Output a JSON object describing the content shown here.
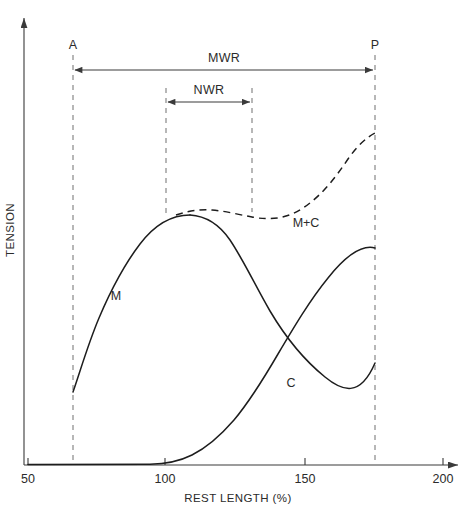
{
  "chart_data": {
    "type": "line",
    "title": "",
    "xlabel": "REST LENGTH (%)",
    "ylabel": "TENSION",
    "xlim": [
      50,
      200
    ],
    "ylim": [
      0,
      1
    ],
    "xticks": [
      50,
      100,
      150,
      200
    ],
    "xtick_labels": [
      "50",
      "100",
      "150",
      "200"
    ],
    "yticks": [],
    "ytick_labels": [],
    "grid": false,
    "legend": false,
    "axis_style": "arrow-ended open axes, no box",
    "series": [
      {
        "name": "M",
        "label": "M",
        "style": "solid",
        "description": "Active (muscle/contractile) tension: rises steeply from the A line, peaks near 110-115% rest length, then falls steadily to the P line.",
        "x": [
          66,
          70,
          75,
          80,
          85,
          90,
          95,
          100,
          105,
          110,
          115,
          120,
          125,
          130,
          135,
          140,
          145,
          150,
          155,
          160,
          165,
          170,
          176
        ],
        "y": [
          0.158,
          0.21,
          0.3,
          0.39,
          0.465,
          0.53,
          0.585,
          0.625,
          0.648,
          0.66,
          0.661,
          0.652,
          0.635,
          0.61,
          0.578,
          0.54,
          0.497,
          0.45,
          0.4,
          0.35,
          0.3,
          0.255,
          0.225
        ]
      },
      {
        "name": "C",
        "label": "C",
        "style": "solid",
        "description": "Passive (connective tissue) tension: flat at zero until about 105-110% rest length, then rises exponentially to the P line.",
        "x": [
          50,
          60,
          70,
          80,
          90,
          100,
          105,
          110,
          115,
          120,
          125,
          130,
          135,
          140,
          145,
          150,
          155,
          160,
          165,
          170,
          176
        ],
        "y": [
          0.0,
          0.0,
          0.0,
          0.0,
          0.0,
          0.003,
          0.006,
          0.014,
          0.028,
          0.048,
          0.073,
          0.104,
          0.14,
          0.182,
          0.23,
          0.285,
          0.345,
          0.41,
          0.48,
          0.555,
          0.645
        ]
      },
      {
        "name": "M+C",
        "label": "M+C",
        "style": "dashed",
        "description": "Total tension (sum of active and passive): follows the M curve up to the peak, dips slightly to a shallow minimum near 140%, then climbs sharply to the P line.",
        "x": [
          104,
          110,
          115,
          120,
          125,
          130,
          135,
          140,
          145,
          150,
          155,
          160,
          165,
          170,
          176
        ],
        "y": [
          0.655,
          0.668,
          0.672,
          0.668,
          0.66,
          0.651,
          0.645,
          0.645,
          0.655,
          0.675,
          0.708,
          0.75,
          0.8,
          0.858,
          0.92
        ]
      }
    ],
    "vertical_markers": [
      {
        "name": "A",
        "label": "A",
        "x": 66,
        "style": "dashed",
        "description": "Shortest active length limit"
      },
      {
        "name": "NWR-left",
        "label": "",
        "x": 100,
        "style": "dashed",
        "description": "Lower bound of normal working range"
      },
      {
        "name": "NWR-right",
        "label": "",
        "x": 131,
        "style": "dashed",
        "description": "Upper bound of normal working range"
      },
      {
        "name": "P",
        "label": "P",
        "x": 176,
        "style": "dashed",
        "description": "Longest passive length limit"
      }
    ],
    "range_annotations": [
      {
        "name": "MWR",
        "label": "MWR",
        "from_x": 66,
        "to_x": 176,
        "description": "Maximum working range, double-headed arrow from A to P"
      },
      {
        "name": "NWR",
        "label": "NWR",
        "from_x": 100,
        "to_x": 131,
        "description": "Normal working range, double-headed arrow"
      }
    ],
    "curve_labels": [
      {
        "name": "M",
        "label": "M",
        "x": 82,
        "y": 0.33
      },
      {
        "name": "C",
        "label": "C",
        "x": 145,
        "y": 0.175
      },
      {
        "name": "M+C",
        "label": "M+C",
        "x": 147,
        "y": 0.545
      }
    ],
    "colors": {
      "curve": "#1d1d1d",
      "axis": "#3a3a3a",
      "marker_line": "#7d7d7d",
      "text": "#2b2b2b",
      "background": "#ffffff"
    }
  },
  "axes": {
    "x_label": "REST LENGTH (%)",
    "y_label": "TENSION",
    "x_tick_labels": [
      "50",
      "100",
      "150",
      "200"
    ]
  },
  "markers": {
    "a_label": "A",
    "p_label": "P"
  },
  "ranges": {
    "mwr_label": "MWR",
    "nwr_label": "NWR"
  },
  "series_labels": {
    "m": "M",
    "c": "C",
    "mc": "M+C"
  }
}
